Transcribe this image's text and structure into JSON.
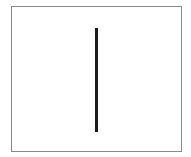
{
  "canvas": {
    "background_color": "#ffffff",
    "border_color": "#8a8a8a"
  },
  "vertical_line": {
    "color": "#1a1a1a",
    "orientation": "vertical"
  }
}
